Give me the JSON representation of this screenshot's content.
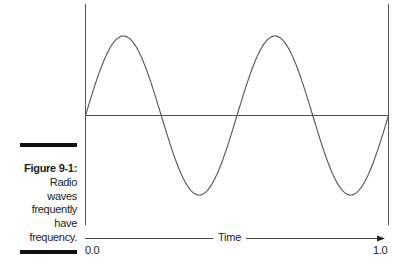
{
  "chart_data": {
    "type": "line",
    "title": "",
    "xlabel": "Time",
    "ylabel": "",
    "xlim": [
      0.0,
      1.0
    ],
    "ylim": [
      -1,
      1
    ],
    "x_ticks": [
      "0.0",
      "1.0"
    ],
    "grid": false,
    "legend": null,
    "series": [
      {
        "name": "Radio wave",
        "description": "Sine wave, 2 full cycles over time 0.0 to 1.0",
        "x": [
          0.0,
          0.125,
          0.25,
          0.375,
          0.5,
          0.625,
          0.75,
          0.875,
          1.0
        ],
        "values": [
          0,
          1,
          0,
          -1,
          0,
          1,
          0,
          -1,
          0
        ]
      }
    ]
  },
  "caption": {
    "figure_label": "Figure 9-1:",
    "lines": [
      "Radio",
      "waves",
      "frequently",
      "have",
      "frequency."
    ]
  },
  "axis": {
    "x_start": "0.0",
    "x_end": "1.0",
    "x_label": "Time"
  },
  "colors": {
    "line": "#555555",
    "text": "#222222",
    "bar": "#111111"
  }
}
